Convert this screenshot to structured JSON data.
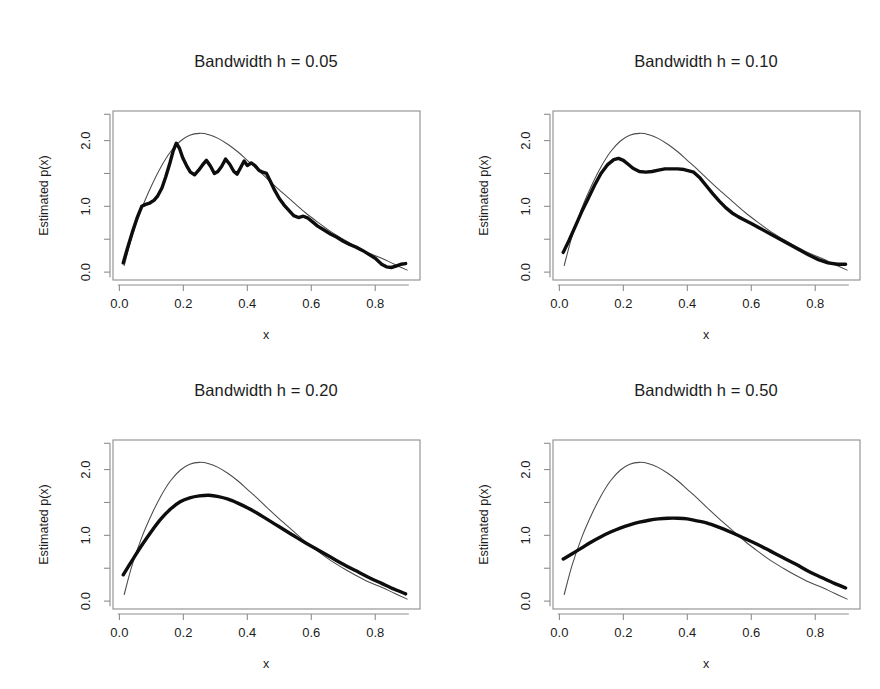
{
  "figure": {
    "background": "#ffffff",
    "width": 880,
    "height": 689,
    "rows": 2,
    "cols": 2
  },
  "chart_data": [
    {
      "type": "line",
      "title": "Bandwidth h = 0.05",
      "xlabel": "x",
      "ylabel": "Estimated p(x)",
      "xlim": [
        -0.02,
        0.94
      ],
      "ylim": [
        -0.12,
        2.45
      ],
      "xticks": [
        0.0,
        0.2,
        0.4,
        0.6,
        0.8
      ],
      "xticklabels": [
        "0.0",
        "0.2",
        "0.4",
        "0.6",
        "0.8"
      ],
      "yticks": [
        0.0,
        1.0,
        2.0
      ],
      "yticklabels": [
        "0.0",
        "1.0",
        "2.0"
      ],
      "yminorticks": [
        0.5,
        1.5,
        2.0
      ],
      "grid": false,
      "legend": "none",
      "series": [
        {
          "name": "true-density",
          "style": "thin",
          "color": "#4a4a4a",
          "x": [
            0.015,
            0.04,
            0.07,
            0.1,
            0.13,
            0.16,
            0.19,
            0.22,
            0.25,
            0.28,
            0.31,
            0.34,
            0.37,
            0.4,
            0.43,
            0.46,
            0.5,
            0.54,
            0.58,
            0.62,
            0.66,
            0.7,
            0.74,
            0.78,
            0.82,
            0.86,
            0.9
          ],
          "y": [
            0.1,
            0.55,
            0.97,
            1.31,
            1.6,
            1.83,
            1.99,
            2.08,
            2.11,
            2.09,
            2.03,
            1.94,
            1.83,
            1.7,
            1.57,
            1.43,
            1.25,
            1.08,
            0.91,
            0.76,
            0.62,
            0.5,
            0.39,
            0.29,
            0.21,
            0.12,
            0.03
          ]
        },
        {
          "name": "kernel-estimate",
          "style": "thick",
          "color": "#0d0d0d",
          "x": [
            0.012,
            0.025,
            0.04,
            0.055,
            0.07,
            0.082,
            0.095,
            0.108,
            0.12,
            0.133,
            0.145,
            0.158,
            0.168,
            0.178,
            0.188,
            0.198,
            0.21,
            0.222,
            0.235,
            0.248,
            0.26,
            0.272,
            0.285,
            0.297,
            0.308,
            0.32,
            0.332,
            0.345,
            0.358,
            0.368,
            0.378,
            0.39,
            0.4,
            0.412,
            0.424,
            0.436,
            0.448,
            0.46,
            0.472,
            0.485,
            0.5,
            0.515,
            0.53,
            0.545,
            0.56,
            0.575,
            0.59,
            0.605,
            0.62,
            0.64,
            0.66,
            0.68,
            0.7,
            0.72,
            0.74,
            0.76,
            0.78,
            0.8,
            0.82,
            0.835,
            0.85,
            0.865,
            0.88,
            0.895
          ],
          "y": [
            0.14,
            0.36,
            0.6,
            0.82,
            1.0,
            1.03,
            1.05,
            1.09,
            1.16,
            1.28,
            1.45,
            1.66,
            1.84,
            1.96,
            1.88,
            1.74,
            1.62,
            1.52,
            1.48,
            1.55,
            1.63,
            1.7,
            1.61,
            1.5,
            1.53,
            1.61,
            1.72,
            1.64,
            1.53,
            1.49,
            1.58,
            1.69,
            1.62,
            1.66,
            1.62,
            1.55,
            1.52,
            1.5,
            1.38,
            1.25,
            1.12,
            1.02,
            0.94,
            0.86,
            0.83,
            0.85,
            0.82,
            0.76,
            0.7,
            0.64,
            0.58,
            0.53,
            0.47,
            0.42,
            0.38,
            0.33,
            0.27,
            0.21,
            0.12,
            0.08,
            0.07,
            0.09,
            0.12,
            0.13
          ]
        }
      ]
    },
    {
      "type": "line",
      "title": "Bandwidth h = 0.10",
      "xlabel": "x",
      "ylabel": "Estimated p(x)",
      "xlim": [
        -0.02,
        0.94
      ],
      "ylim": [
        -0.12,
        2.45
      ],
      "xticks": [
        0.0,
        0.2,
        0.4,
        0.6,
        0.8
      ],
      "xticklabels": [
        "0.0",
        "0.2",
        "0.4",
        "0.6",
        "0.8"
      ],
      "yticks": [
        0.0,
        1.0,
        2.0
      ],
      "yticklabels": [
        "0.0",
        "1.0",
        "2.0"
      ],
      "yminorticks": [
        0.5,
        1.5,
        2.0
      ],
      "grid": false,
      "legend": "none",
      "series": [
        {
          "name": "true-density",
          "style": "thin",
          "color": "#4a4a4a",
          "x": [
            0.015,
            0.04,
            0.07,
            0.1,
            0.13,
            0.16,
            0.19,
            0.22,
            0.25,
            0.28,
            0.31,
            0.34,
            0.37,
            0.4,
            0.43,
            0.46,
            0.5,
            0.54,
            0.58,
            0.62,
            0.66,
            0.7,
            0.74,
            0.78,
            0.82,
            0.86,
            0.9
          ],
          "y": [
            0.1,
            0.55,
            0.97,
            1.31,
            1.6,
            1.83,
            1.99,
            2.08,
            2.11,
            2.09,
            2.03,
            1.94,
            1.83,
            1.7,
            1.57,
            1.43,
            1.25,
            1.08,
            0.91,
            0.76,
            0.62,
            0.5,
            0.39,
            0.29,
            0.21,
            0.12,
            0.03
          ]
        },
        {
          "name": "kernel-estimate",
          "style": "thick",
          "color": "#0d0d0d",
          "x": [
            0.012,
            0.03,
            0.05,
            0.07,
            0.09,
            0.11,
            0.13,
            0.15,
            0.17,
            0.185,
            0.2,
            0.215,
            0.23,
            0.25,
            0.27,
            0.29,
            0.31,
            0.33,
            0.35,
            0.37,
            0.39,
            0.405,
            0.42,
            0.44,
            0.46,
            0.48,
            0.5,
            0.52,
            0.54,
            0.56,
            0.58,
            0.6,
            0.63,
            0.66,
            0.69,
            0.72,
            0.75,
            0.78,
            0.81,
            0.84,
            0.87,
            0.895
          ],
          "y": [
            0.3,
            0.48,
            0.7,
            0.92,
            1.12,
            1.32,
            1.5,
            1.63,
            1.71,
            1.73,
            1.7,
            1.64,
            1.58,
            1.53,
            1.52,
            1.53,
            1.55,
            1.57,
            1.57,
            1.57,
            1.56,
            1.54,
            1.52,
            1.43,
            1.31,
            1.19,
            1.08,
            0.98,
            0.9,
            0.84,
            0.79,
            0.74,
            0.66,
            0.58,
            0.5,
            0.42,
            0.34,
            0.26,
            0.19,
            0.14,
            0.12,
            0.12
          ]
        }
      ]
    },
    {
      "type": "line",
      "title": "Bandwidth h = 0.20",
      "xlabel": "x",
      "ylabel": "Estimated p(x)",
      "xlim": [
        -0.02,
        0.94
      ],
      "ylim": [
        -0.12,
        2.45
      ],
      "xticks": [
        0.0,
        0.2,
        0.4,
        0.6,
        0.8
      ],
      "xticklabels": [
        "0.0",
        "0.2",
        "0.4",
        "0.6",
        "0.8"
      ],
      "yticks": [
        0.0,
        1.0,
        2.0
      ],
      "yticklabels": [
        "0.0",
        "1.0",
        "2.0"
      ],
      "yminorticks": [
        0.5,
        1.5,
        2.0
      ],
      "grid": false,
      "legend": "none",
      "series": [
        {
          "name": "true-density",
          "style": "thin",
          "color": "#4a4a4a",
          "x": [
            0.015,
            0.04,
            0.07,
            0.1,
            0.13,
            0.16,
            0.19,
            0.22,
            0.25,
            0.28,
            0.31,
            0.34,
            0.37,
            0.4,
            0.43,
            0.46,
            0.5,
            0.54,
            0.58,
            0.62,
            0.66,
            0.7,
            0.74,
            0.78,
            0.82,
            0.86,
            0.9
          ],
          "y": [
            0.1,
            0.55,
            0.97,
            1.31,
            1.6,
            1.83,
            1.99,
            2.08,
            2.11,
            2.09,
            2.03,
            1.94,
            1.83,
            1.7,
            1.57,
            1.43,
            1.25,
            1.08,
            0.91,
            0.76,
            0.62,
            0.5,
            0.39,
            0.29,
            0.21,
            0.12,
            0.03
          ]
        },
        {
          "name": "kernel-estimate",
          "style": "thick",
          "color": "#0d0d0d",
          "x": [
            0.012,
            0.04,
            0.07,
            0.1,
            0.13,
            0.16,
            0.19,
            0.22,
            0.25,
            0.28,
            0.31,
            0.34,
            0.37,
            0.4,
            0.43,
            0.46,
            0.5,
            0.54,
            0.58,
            0.62,
            0.66,
            0.7,
            0.74,
            0.78,
            0.82,
            0.86,
            0.895
          ],
          "y": [
            0.4,
            0.62,
            0.85,
            1.06,
            1.25,
            1.4,
            1.51,
            1.57,
            1.6,
            1.61,
            1.59,
            1.55,
            1.49,
            1.42,
            1.34,
            1.25,
            1.13,
            1.01,
            0.89,
            0.78,
            0.67,
            0.56,
            0.46,
            0.36,
            0.27,
            0.18,
            0.11
          ]
        }
      ]
    },
    {
      "type": "line",
      "title": "Bandwidth h = 0.50",
      "xlabel": "x",
      "ylabel": "Estimated p(x)",
      "xlim": [
        -0.02,
        0.94
      ],
      "ylim": [
        -0.12,
        2.45
      ],
      "xticks": [
        0.0,
        0.2,
        0.4,
        0.6,
        0.8
      ],
      "xticklabels": [
        "0.0",
        "0.2",
        "0.4",
        "0.6",
        "0.8"
      ],
      "yticks": [
        0.0,
        1.0,
        2.0
      ],
      "yticklabels": [
        "0.0",
        "1.0",
        "2.0"
      ],
      "yminorticks": [
        0.5,
        1.5,
        2.0
      ],
      "grid": false,
      "legend": "none",
      "series": [
        {
          "name": "true-density",
          "style": "thin",
          "color": "#4a4a4a",
          "x": [
            0.015,
            0.04,
            0.07,
            0.1,
            0.13,
            0.16,
            0.19,
            0.22,
            0.25,
            0.28,
            0.31,
            0.34,
            0.37,
            0.4,
            0.43,
            0.46,
            0.5,
            0.54,
            0.58,
            0.62,
            0.66,
            0.7,
            0.74,
            0.78,
            0.82,
            0.86,
            0.9
          ],
          "y": [
            0.1,
            0.55,
            0.97,
            1.31,
            1.6,
            1.83,
            1.99,
            2.08,
            2.11,
            2.09,
            2.03,
            1.94,
            1.83,
            1.7,
            1.57,
            1.43,
            1.25,
            1.08,
            0.91,
            0.76,
            0.62,
            0.5,
            0.39,
            0.29,
            0.21,
            0.12,
            0.03
          ]
        },
        {
          "name": "kernel-estimate",
          "style": "thick",
          "color": "#0d0d0d",
          "x": [
            0.012,
            0.04,
            0.07,
            0.1,
            0.13,
            0.16,
            0.19,
            0.22,
            0.25,
            0.28,
            0.31,
            0.34,
            0.37,
            0.4,
            0.43,
            0.46,
            0.5,
            0.54,
            0.58,
            0.62,
            0.66,
            0.7,
            0.74,
            0.78,
            0.82,
            0.86,
            0.895
          ],
          "y": [
            0.64,
            0.72,
            0.81,
            0.9,
            0.98,
            1.05,
            1.11,
            1.16,
            1.2,
            1.23,
            1.25,
            1.26,
            1.26,
            1.25,
            1.22,
            1.19,
            1.12,
            1.04,
            0.95,
            0.86,
            0.76,
            0.66,
            0.56,
            0.45,
            0.36,
            0.27,
            0.2
          ]
        }
      ]
    }
  ]
}
